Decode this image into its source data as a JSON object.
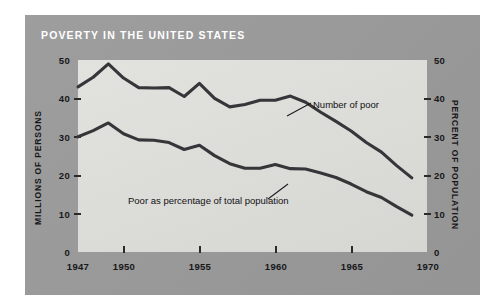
{
  "figure": {
    "title": "POVERTY IN THE UNITED STATES",
    "panel_color": "#9a9a9a",
    "plot_bg_color": "#dcdcd8",
    "line_color": "#36363a",
    "title_color": "#ffffff",
    "text_color": "#17171a"
  },
  "axes": {
    "left_title": "MILLIONS OF PERSONS",
    "right_title": "PERCENT OF POPULATION",
    "y_ticks": [
      "0",
      "10",
      "20",
      "30",
      "40",
      "50"
    ],
    "x_ticks": [
      "1947",
      "1950",
      "1955",
      "1960",
      "1965",
      "1970"
    ]
  },
  "annotations": {
    "upper": "Number of poor",
    "lower": "Poor as percentage of total population"
  },
  "chart_data": {
    "type": "line",
    "title": "POVERTY IN THE UNITED STATES",
    "xlabel": "",
    "ylabel": "MILLIONS OF PERSONS",
    "y2label": "PERCENT OF POPULATION",
    "xlim": [
      1947,
      1970
    ],
    "ylim": [
      0,
      50
    ],
    "y2lim": [
      0,
      50
    ],
    "grid": false,
    "legend": "inline-annotations",
    "x": [
      1947,
      1948,
      1949,
      1950,
      1951,
      1952,
      1953,
      1954,
      1955,
      1956,
      1957,
      1958,
      1959,
      1960,
      1961,
      1962,
      1963,
      1964,
      1965,
      1966,
      1967,
      1968,
      1969
    ],
    "series": [
      {
        "name": "Number of poor",
        "unit": "millions of persons",
        "axis": "left",
        "values": [
          43.0,
          45.5,
          49.0,
          45.3,
          42.8,
          42.7,
          42.8,
          40.5,
          43.9,
          40.0,
          37.8,
          38.4,
          39.5,
          39.5,
          40.6,
          39.0,
          36.4,
          34.0,
          31.5,
          28.5,
          26.0,
          22.5,
          19.3
        ]
      },
      {
        "name": "Poor as percentage of total population",
        "unit": "percent of population",
        "axis": "right",
        "values": [
          30.0,
          31.6,
          33.6,
          30.8,
          29.2,
          29.1,
          28.5,
          26.7,
          27.8,
          25.1,
          23.0,
          21.8,
          21.8,
          22.8,
          21.7,
          21.6,
          20.6,
          19.4,
          17.7,
          15.7,
          14.2,
          11.8,
          9.6
        ]
      }
    ]
  }
}
